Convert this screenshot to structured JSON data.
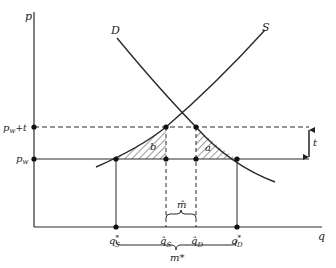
{
  "axes": {
    "y_label": "p",
    "x_label": "q"
  },
  "curves": {
    "demand_label": "D",
    "supply_label": "S"
  },
  "price_levels": {
    "world_price_label": "p",
    "world_price_sub": "w",
    "tariff_price_label": "p",
    "tariff_price_sub": "w",
    "tariff_price_suffix": "+t"
  },
  "areas": {
    "left_triangle_label": "b",
    "right_triangle_label": "a"
  },
  "tariff": {
    "label": "t"
  },
  "quantities": {
    "qs_star": {
      "base": "q",
      "sup": "*",
      "sub": "S"
    },
    "qs_hat": {
      "base": "q̂",
      "sub": "S"
    },
    "qd_hat": {
      "base": "q̂",
      "sub": "D"
    },
    "qd_star": {
      "base": "q",
      "sup": "*",
      "sub": "D"
    }
  },
  "imports": {
    "m_hat_label": "m̂",
    "m_star_label": "m*"
  },
  "colors": {
    "line": "#2a2a2a",
    "background": "#ffffff"
  }
}
